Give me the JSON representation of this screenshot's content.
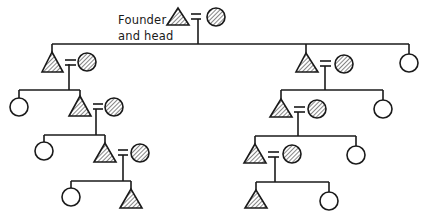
{
  "diagram": {
    "type": "kinship-genealogy",
    "label": {
      "line1": "Founder",
      "line2": "and head"
    },
    "legend_symbols": {
      "triangle": "male",
      "circle": "female",
      "hatched": "member of the lineage line / married-in spouse (shaded)",
      "equals": "marriage"
    },
    "colors": {
      "stroke": "#1a1a1a",
      "background": "#ffffff",
      "hatch": "#333333"
    },
    "generations": [
      {
        "level": 0,
        "members": [
          {
            "id": "founder",
            "sex": "male",
            "hatched": true,
            "spouse": {
              "sex": "female",
              "hatched": true
            }
          }
        ]
      },
      {
        "level": 1,
        "parent": "founder",
        "members": [
          {
            "id": "g1-left",
            "sex": "male",
            "hatched": true,
            "spouse": {
              "sex": "female",
              "hatched": true
            }
          },
          {
            "id": "g1-mid",
            "sex": "male",
            "hatched": true,
            "spouse": {
              "sex": "female",
              "hatched": true
            }
          },
          {
            "id": "g1-right",
            "sex": "female",
            "hatched": false
          }
        ]
      },
      {
        "level": 2,
        "branches": [
          {
            "parent": "g1-left",
            "members": [
              {
                "id": "g2-l-a",
                "sex": "female",
                "hatched": false
              },
              {
                "id": "g2-l-b",
                "sex": "male",
                "hatched": true,
                "spouse": {
                  "sex": "female",
                  "hatched": true
                }
              }
            ]
          },
          {
            "parent": "g1-mid",
            "members": [
              {
                "id": "g2-r-a",
                "sex": "male",
                "hatched": true,
                "spouse": {
                  "sex": "female",
                  "hatched": true
                }
              },
              {
                "id": "g2-r-b",
                "sex": "female",
                "hatched": false
              }
            ]
          }
        ]
      },
      {
        "level": 3,
        "branches": [
          {
            "parent": "g2-l-b",
            "members": [
              {
                "id": "g3-l-a",
                "sex": "female",
                "hatched": false
              },
              {
                "id": "g3-l-b",
                "sex": "male",
                "hatched": true,
                "spouse": {
                  "sex": "female",
                  "hatched": true
                }
              }
            ]
          },
          {
            "parent": "g2-r-a",
            "members": [
              {
                "id": "g3-r-a",
                "sex": "male",
                "hatched": true,
                "spouse": {
                  "sex": "female",
                  "hatched": true
                }
              },
              {
                "id": "g3-r-b",
                "sex": "female",
                "hatched": false
              }
            ]
          }
        ]
      },
      {
        "level": 4,
        "branches": [
          {
            "parent": "g3-l-b",
            "members": [
              {
                "id": "g4-l-a",
                "sex": "female",
                "hatched": false
              },
              {
                "id": "g4-l-b",
                "sex": "male",
                "hatched": true
              }
            ]
          },
          {
            "parent": "g3-r-a",
            "members": [
              {
                "id": "g4-r-a",
                "sex": "male",
                "hatched": true
              },
              {
                "id": "g4-r-b",
                "sex": "female",
                "hatched": false
              }
            ]
          }
        ]
      }
    ]
  }
}
